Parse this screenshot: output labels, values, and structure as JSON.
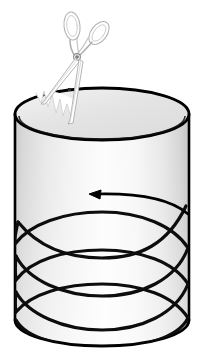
{
  "figure": {
    "title": "Cylinder with helical spiral being cut by scissors",
    "canvas": {
      "width": 204,
      "height": 353,
      "background": "#ffffff"
    },
    "colors": {
      "outline": "#000000",
      "spiral": "#0d0d0d",
      "arrow": "#000000",
      "cylinder_fill_light": "#fbfbfb",
      "cylinder_fill_shade": "#d8d8d8",
      "cylinder_top_fill": "#e9e9e9",
      "scissors_outline": "#b5b5b5",
      "scissors_fill": "#ffffff",
      "cut_edge": "#ffffff"
    }
  },
  "cylinder": {
    "label": "cylinder-body",
    "center_x": 102,
    "left_x": 15,
    "right_x": 189,
    "radius_x": 87,
    "top_center_y": 114,
    "bottom_center_y": 320,
    "ellipse_radius_y": 26,
    "top_rim_label": "top-rim-ellipse",
    "bottom_rim_label": "bottom-rim-ellipse"
  },
  "spiral": {
    "label": "helical-spiral",
    "turns": 3.6,
    "start_y": 192,
    "end_y": 344,
    "pitch": 42,
    "stroke_width": 3.2,
    "direction": "counterclockwise-viewed-from-top"
  },
  "arrow": {
    "label": "direction-arrow",
    "points_to": "left",
    "tip_x": 92,
    "tip_y": 194,
    "tail_x": 186,
    "tail_y": 206,
    "stroke_width": 2.6
  },
  "scissors": {
    "label": "scissors",
    "pivot_x": 77,
    "pivot_y": 57,
    "handle_left_label": "scissors-handle-loop-left",
    "handle_right_label": "scissors-handle-loop-right",
    "blade_upper_label": "scissors-blade-upper",
    "blade_lower_label": "scissors-blade-lower",
    "tip_x": 44,
    "tip_y": 104,
    "stroke_width": 0.9
  },
  "cut_edge": {
    "label": "jagged-cut-edge",
    "teeth": 6,
    "start_x": 36,
    "start_y": 92,
    "end_x": 72,
    "end_y": 117
  },
  "annotations": {
    "caption": "",
    "legend": []
  }
}
